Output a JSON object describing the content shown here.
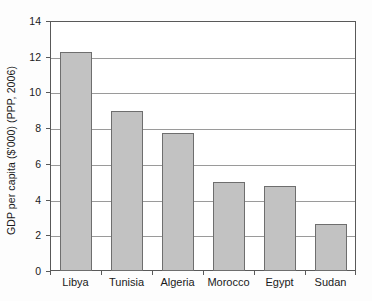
{
  "chart_data": {
    "type": "bar",
    "title": "",
    "subtitle": "",
    "xlabel": "",
    "ylabel": "GDP per capita ($'000) (PPP, 2006)",
    "categories": [
      "Libya",
      "Tunisia",
      "Algeria",
      "Morocco",
      "Egypt",
      "Sudan"
    ],
    "values": [
      12.25,
      8.95,
      7.75,
      5.0,
      4.75,
      2.65
    ],
    "ylim": [
      0,
      14
    ],
    "ytick_step": 2,
    "ytick_labels": [
      "0",
      "2",
      "4",
      "6",
      "8",
      "10",
      "12",
      "14"
    ],
    "ytick_values": [
      0,
      2,
      4,
      6,
      8,
      10,
      12,
      14
    ],
    "grid": "horizontal",
    "legend": "none",
    "annotations": [],
    "colors": {
      "bar_fill": "#c2c2c2",
      "bar_border": "#6e6e6e",
      "gridline": "#9a9a9a",
      "axis": "#595959",
      "text": "#1a1a1a",
      "plot_background": "#ffffff",
      "figure_background": "#fdfdfd"
    }
  }
}
